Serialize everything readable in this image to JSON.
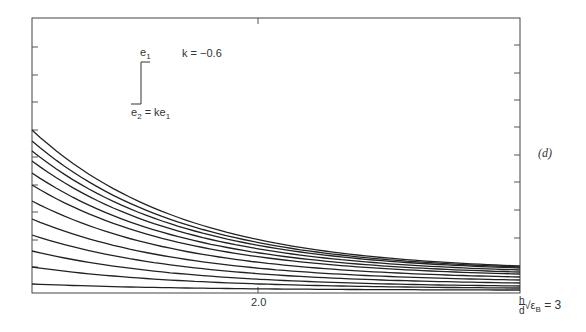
{
  "chart_data": {
    "type": "line",
    "title": "",
    "panel_label": "(d)",
    "annotation_k": "k = −0.6",
    "inset_top_label": "e1",
    "inset_bottom_label": "e2 = ke1",
    "xlabel": "h/d √εB = 3",
    "x_tick_labels": [
      "2.0"
    ],
    "xlim": [
      0,
      3
    ],
    "ylabel": "",
    "grid": false,
    "legend": "none",
    "series_count": 12,
    "series": [
      {
        "name": "curve 1",
        "start_y_px": 130,
        "end_y_px": 266
      },
      {
        "name": "curve 2",
        "start_y_px": 141,
        "end_y_px": 267
      },
      {
        "name": "curve 3",
        "start_y_px": 151,
        "end_y_px": 268
      },
      {
        "name": "curve 4",
        "start_y_px": 161,
        "end_y_px": 270
      },
      {
        "name": "curve 5",
        "start_y_px": 173,
        "end_y_px": 272
      },
      {
        "name": "curve 6",
        "start_y_px": 185,
        "end_y_px": 274
      },
      {
        "name": "curve 7",
        "start_y_px": 201,
        "end_y_px": 277
      },
      {
        "name": "curve 8",
        "start_y_px": 219,
        "end_y_px": 280
      },
      {
        "name": "curve 9",
        "start_y_px": 235,
        "end_y_px": 283
      },
      {
        "name": "curve 10",
        "start_y_px": 251,
        "end_y_px": 286
      },
      {
        "name": "curve 11",
        "start_y_px": 267,
        "end_y_px": 288
      },
      {
        "name": "curve 12",
        "start_y_px": 284,
        "end_y_px": 290
      }
    ]
  },
  "labels": {
    "panel": "(d)",
    "k": "k = −0.6",
    "e1": "e",
    "e1_sub": "1",
    "e2": "e",
    "e2_sub": "2",
    "e2_eq": " = ke",
    "e2_eq_sub": "1",
    "x_tick_2": "2.0",
    "xlabel_h": "h",
    "xlabel_d": "d",
    "xlabel_rest": "√ε",
    "xlabel_sub": "B",
    "xlabel_eq": " = 3"
  }
}
